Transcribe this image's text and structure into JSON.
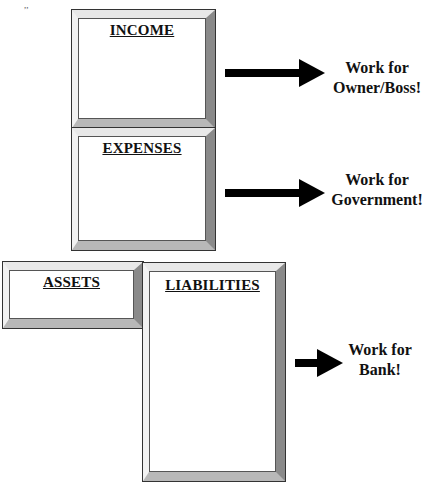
{
  "boxes": {
    "income": {
      "title": "INCOME"
    },
    "expenses": {
      "title": "EXPENSES"
    },
    "assets": {
      "title": "ASSETS"
    },
    "liabilities": {
      "title": "LIABILITIES"
    }
  },
  "arrows": [
    {
      "label_line1": "Work for",
      "label_line2": "Owner/Boss!"
    },
    {
      "label_line1": "Work for",
      "label_line2": "Government!"
    },
    {
      "label_line1": "Work for",
      "label_line2": "Bank!"
    }
  ],
  "colors": {
    "arrow": "#000000",
    "bevel_dark": "#8a8a8a",
    "bevel_light": "#e8e8e8"
  }
}
